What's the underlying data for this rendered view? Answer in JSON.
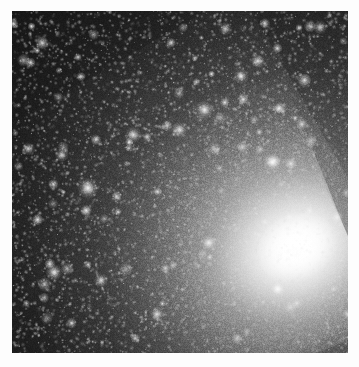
{
  "image": {
    "kind": "astronomical-photograph",
    "subject": "galaxy-with-bright-nucleus-and-dense-star-field",
    "color_mode": "grayscale",
    "canvas_width": 359,
    "canvas_height": 367,
    "border": {
      "color": "#fdfdfd",
      "left": 12,
      "top": 11,
      "right": 11,
      "bottom": 14
    },
    "plate": {
      "x": 12,
      "y": 11,
      "width": 336,
      "height": 342,
      "background_color": "#161616"
    },
    "palette": {
      "sky_darkest": "#141414",
      "sky_dark": "#1c1c1c",
      "sky_mid": "#3a3a3a",
      "halo_mid": "#9a9a9a",
      "halo_bright": "#d2d2d2",
      "nucleus": "#ffffff",
      "matte": "#fdfdfd"
    },
    "nucleus": {
      "center_x_pct": 84.7,
      "center_y_pct": 69.0,
      "rotation_deg": -27,
      "core_radius_px": 22,
      "bulge_radius_px": 85,
      "halo_radius_px": 210,
      "peak_brightness": 255,
      "elongation_axis": "NE-SW"
    },
    "starfield": {
      "total_points": 5200,
      "bright_stars": 95,
      "seed": 20240617,
      "grain_opacity": 0.55,
      "grain_cell_px": 1
    },
    "notable_stars": [
      {
        "x_pct": 22.6,
        "y_pct": 51.8,
        "size": 3.2,
        "brightness": 0.95
      },
      {
        "x_pct": 12.5,
        "y_pct": 76.4,
        "size": 2.6,
        "brightness": 0.88
      },
      {
        "x_pct": 57.3,
        "y_pct": 28.9,
        "size": 2.8,
        "brightness": 0.92
      },
      {
        "x_pct": 49.8,
        "y_pct": 34.7,
        "size": 2.4,
        "brightness": 0.84
      },
      {
        "x_pct": 36.1,
        "y_pct": 36.2,
        "size": 2.5,
        "brightness": 0.86
      },
      {
        "x_pct": 68.2,
        "y_pct": 19.1,
        "size": 2.3,
        "brightness": 0.82
      },
      {
        "x_pct": 77.4,
        "y_pct": 44.2,
        "size": 2.7,
        "brightness": 0.9
      },
      {
        "x_pct": 58.6,
        "y_pct": 67.8,
        "size": 2.4,
        "brightness": 0.85
      },
      {
        "x_pct": 79.1,
        "y_pct": 81.3,
        "size": 2.5,
        "brightness": 0.87
      },
      {
        "x_pct": 26.5,
        "y_pct": 78.8,
        "size": 2.2,
        "brightness": 0.8
      },
      {
        "x_pct": 14.8,
        "y_pct": 42.1,
        "size": 2.1,
        "brightness": 0.78
      },
      {
        "x_pct": 43.2,
        "y_pct": 88.6,
        "size": 2.2,
        "brightness": 0.79
      },
      {
        "x_pct": 4.9,
        "y_pct": 40.3,
        "size": 2.0,
        "brightness": 0.76
      },
      {
        "x_pct": 91.7,
        "y_pct": 4.8,
        "size": 2.1,
        "brightness": 0.77
      },
      {
        "x_pct": 63.5,
        "y_pct": 5.2,
        "size": 2.0,
        "brightness": 0.75
      }
    ]
  }
}
